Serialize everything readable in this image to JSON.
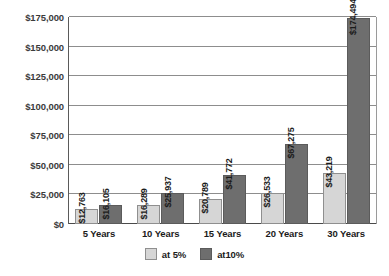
{
  "chart_data": {
    "type": "bar",
    "title": "",
    "subtitle": "",
    "xlabel": "",
    "ylabel": "",
    "categories": [
      "5 Years",
      "10 Years",
      "15 Years",
      "20 Years",
      "30 Years"
    ],
    "series": [
      {
        "name": "at 5%",
        "color": "#d6d6d6",
        "values": [
          12763,
          16289,
          20789,
          26533,
          43219
        ],
        "labels": [
          "$12,763",
          "$16,289",
          "$20,789",
          "$26,533",
          "$43,219"
        ]
      },
      {
        "name": "at10%",
        "color": "#6e6e6e",
        "values": [
          16105,
          25937,
          41772,
          67275,
          174494
        ],
        "labels": [
          "$16,105",
          "$25,937",
          "$41,772",
          "$67,275",
          "$174,494"
        ]
      }
    ],
    "ylim": [
      0,
      175000
    ],
    "ytick_step": 25000,
    "yticks": [
      0,
      25000,
      50000,
      75000,
      100000,
      125000,
      150000,
      175000
    ],
    "ytick_labels": [
      "$0",
      "$25,000",
      "$50,000",
      "$75,000",
      "$100,000",
      "$125,000",
      "$150,000",
      "$175,000"
    ],
    "grid": true,
    "legend_position": "bottom",
    "background_color": "#ffffff",
    "gridline_color": "#8d8d8d",
    "axis_color": "#4a4a4a"
  },
  "legend": {
    "items": [
      {
        "label": "at 5%"
      },
      {
        "label": "at10%"
      }
    ]
  }
}
